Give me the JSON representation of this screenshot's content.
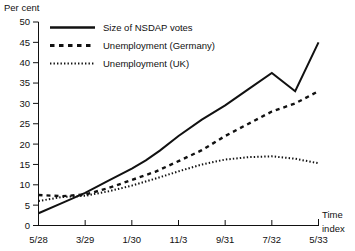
{
  "chart_data": {
    "type": "line",
    "title": "",
    "ylabel": "Per cent",
    "xlabel": "Time index",
    "ylim": [
      0,
      50
    ],
    "ytick_step": 5,
    "yticks": [
      "0",
      "5",
      "10",
      "15",
      "20",
      "25",
      "30",
      "35",
      "40",
      "45",
      "50"
    ],
    "grid": false,
    "legend_position": "top-left",
    "categories": [
      "5/28",
      "3/29",
      "1/30",
      "11/3",
      "9/31",
      "7/32",
      "5/33"
    ],
    "x": [
      0,
      1,
      2,
      3,
      4,
      5,
      6
    ],
    "series": [
      {
        "name": "Size of NSDAP votes",
        "style": "solid",
        "x": [
          0,
          0.5,
          1,
          1.5,
          2,
          2.3,
          2.6,
          3,
          3.5,
          4,
          4.5,
          5,
          5.5,
          6
        ],
        "values": [
          3,
          5.5,
          8,
          11,
          14,
          16,
          18.4,
          22,
          26,
          29.5,
          33.5,
          37.5,
          33,
          45
        ]
      },
      {
        "name": "Unemployment (Germany)",
        "style": "dashed",
        "x": [
          0,
          0.5,
          1,
          1.5,
          2,
          2.5,
          3,
          3.5,
          4,
          4.5,
          5,
          5.5,
          6
        ],
        "values": [
          7.5,
          7.2,
          7.6,
          9.2,
          11.2,
          13.2,
          15.8,
          18.5,
          22,
          25,
          28,
          30,
          33
        ]
      },
      {
        "name": "Unemployment (UK)",
        "style": "dotted",
        "x": [
          0,
          0.5,
          1,
          1.5,
          2,
          2.5,
          3,
          3.5,
          4,
          4.5,
          5,
          5.5,
          6
        ],
        "values": [
          6,
          7,
          7.3,
          8.4,
          9.8,
          11.5,
          13.3,
          15,
          16.2,
          16.8,
          17,
          16.4,
          15.3
        ]
      }
    ]
  },
  "legend": {
    "items": [
      {
        "label": "Size of NSDAP votes"
      },
      {
        "label": "Unemployment (Germany)"
      },
      {
        "label": "Unemployment (UK)"
      }
    ]
  },
  "axis": {
    "y_title": "Per cent",
    "x_title_line1": "Time",
    "x_title_line2": "index"
  }
}
